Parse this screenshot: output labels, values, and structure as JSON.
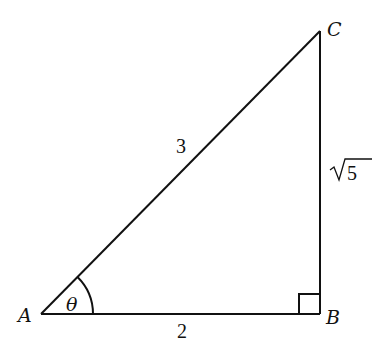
{
  "diagram": {
    "type": "right-triangle",
    "vertices": {
      "A": {
        "label": "A",
        "x": 41,
        "y": 314
      },
      "B": {
        "label": "B",
        "x": 320,
        "y": 314
      },
      "C": {
        "label": "C",
        "x": 320,
        "y": 31
      }
    },
    "sides": {
      "AB": {
        "label": "2"
      },
      "AC": {
        "label": "3"
      },
      "BC": {
        "label": "√5",
        "radicand": "5"
      }
    },
    "angle": {
      "vertex": "A",
      "label": "θ"
    },
    "right_angle_at": "B",
    "colors": {
      "stroke": "#111111",
      "background": "#ffffff"
    }
  }
}
